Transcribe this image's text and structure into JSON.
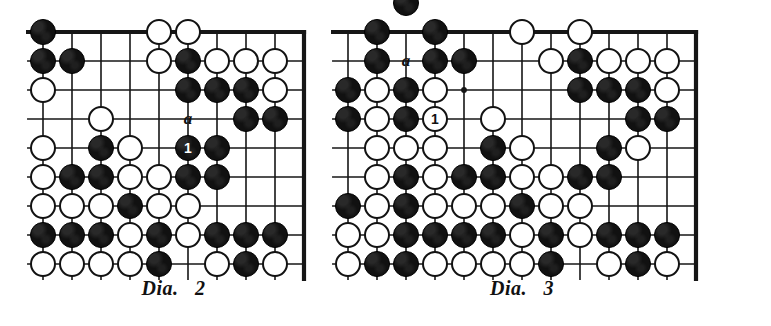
{
  "figure": {
    "kind": "go-board-diagram-pair",
    "colors": {
      "black_stone": "#111111",
      "white_stone": "#ffffff",
      "line": "#161616",
      "background": "#ffffff"
    }
  },
  "diagrams": [
    {
      "id": "dia-2",
      "caption": "Dia.   2",
      "caption_text": "Dia. 2",
      "number": "2",
      "origin": {
        "x": 43,
        "y": 32
      },
      "spacing": 29,
      "cols": 10,
      "rows": 9,
      "stone_radius": 13,
      "edges": {
        "top": true,
        "right": true,
        "left": false,
        "bottom": false
      },
      "star_points": [
        {
          "col": 1,
          "row": 2
        }
      ],
      "black_stones": [
        {
          "col": 0,
          "row": 1
        },
        {
          "col": 0,
          "row": 2
        },
        {
          "col": 1,
          "row": 2
        },
        {
          "col": 2,
          "row": 5
        },
        {
          "col": 5,
          "row": 2
        },
        {
          "col": 5,
          "row": 3
        },
        {
          "col": 6,
          "row": 3
        },
        {
          "col": 7,
          "row": 3
        },
        {
          "col": 7,
          "row": 4
        },
        {
          "col": 8,
          "row": 4
        },
        {
          "col": 6,
          "row": 5
        },
        {
          "col": 1,
          "row": 6
        },
        {
          "col": 2,
          "row": 6
        },
        {
          "col": 5,
          "row": 6
        },
        {
          "col": 6,
          "row": 6
        },
        {
          "col": 3,
          "row": 7
        },
        {
          "col": 0,
          "row": 8
        },
        {
          "col": 1,
          "row": 8
        },
        {
          "col": 2,
          "row": 8
        },
        {
          "col": 4,
          "row": 8
        },
        {
          "col": 6,
          "row": 8
        },
        {
          "col": 7,
          "row": 8
        },
        {
          "col": 8,
          "row": 8
        },
        {
          "col": 4,
          "row": 9
        },
        {
          "col": 7,
          "row": 9
        }
      ],
      "white_stones": [
        {
          "col": 4,
          "row": 1
        },
        {
          "col": 5,
          "row": 1
        },
        {
          "col": 0,
          "row": 3
        },
        {
          "col": 4,
          "row": 2
        },
        {
          "col": 6,
          "row": 2
        },
        {
          "col": 7,
          "row": 2
        },
        {
          "col": 8,
          "row": 2
        },
        {
          "col": 8,
          "row": 3
        },
        {
          "col": 2,
          "row": 4
        },
        {
          "col": 0,
          "row": 5
        },
        {
          "col": 3,
          "row": 5
        },
        {
          "col": 0,
          "row": 6
        },
        {
          "col": 3,
          "row": 6
        },
        {
          "col": 4,
          "row": 6
        },
        {
          "col": 0,
          "row": 7
        },
        {
          "col": 1,
          "row": 7
        },
        {
          "col": 2,
          "row": 7
        },
        {
          "col": 4,
          "row": 7
        },
        {
          "col": 5,
          "row": 7
        },
        {
          "col": 3,
          "row": 8
        },
        {
          "col": 5,
          "row": 8
        },
        {
          "col": 0,
          "row": 9
        },
        {
          "col": 1,
          "row": 9
        },
        {
          "col": 2,
          "row": 9
        },
        {
          "col": 3,
          "row": 9
        },
        {
          "col": 6,
          "row": 9
        },
        {
          "col": 8,
          "row": 9
        }
      ],
      "move_markers": [
        {
          "label": "1",
          "col": 5,
          "row": 5,
          "color": "black"
        }
      ],
      "point_labels": [
        {
          "label": "a",
          "col": 5,
          "row": 4
        }
      ]
    },
    {
      "id": "dia-3",
      "caption": "Dia.   3",
      "caption_text": "Dia. 3",
      "number": "3",
      "origin": {
        "x": 348,
        "y": 32
      },
      "spacing": 29,
      "cols": 13,
      "rows": 9,
      "stone_radius": 13,
      "edges": {
        "top": true,
        "right": true,
        "left": false,
        "bottom": false
      },
      "star_points": [
        {
          "col": 4,
          "row": 3
        }
      ],
      "black_stones": [
        {
          "col": 2,
          "row": 0
        },
        {
          "col": 1,
          "row": 1
        },
        {
          "col": 3,
          "row": 1
        },
        {
          "col": 1,
          "row": 2
        },
        {
          "col": 3,
          "row": 2
        },
        {
          "col": 4,
          "row": 2
        },
        {
          "col": 8,
          "row": 2
        },
        {
          "col": 0,
          "row": 3
        },
        {
          "col": 2,
          "row": 3
        },
        {
          "col": 8,
          "row": 3
        },
        {
          "col": 9,
          "row": 3
        },
        {
          "col": 10,
          "row": 3
        },
        {
          "col": 0,
          "row": 4
        },
        {
          "col": 2,
          "row": 4
        },
        {
          "col": 10,
          "row": 4
        },
        {
          "col": 11,
          "row": 4
        },
        {
          "col": 5,
          "row": 5
        },
        {
          "col": 9,
          "row": 5
        },
        {
          "col": 2,
          "row": 6
        },
        {
          "col": 4,
          "row": 6
        },
        {
          "col": 5,
          "row": 6
        },
        {
          "col": 8,
          "row": 6
        },
        {
          "col": 9,
          "row": 6
        },
        {
          "col": 0,
          "row": 7
        },
        {
          "col": 2,
          "row": 7
        },
        {
          "col": 6,
          "row": 7
        },
        {
          "col": 2,
          "row": 8
        },
        {
          "col": 3,
          "row": 8
        },
        {
          "col": 4,
          "row": 8
        },
        {
          "col": 5,
          "row": 8
        },
        {
          "col": 7,
          "row": 8
        },
        {
          "col": 9,
          "row": 8
        },
        {
          "col": 10,
          "row": 8
        },
        {
          "col": 11,
          "row": 8
        },
        {
          "col": 1,
          "row": 9
        },
        {
          "col": 2,
          "row": 9
        },
        {
          "col": 7,
          "row": 9
        },
        {
          "col": 10,
          "row": 9
        }
      ],
      "white_stones": [
        {
          "col": 6,
          "row": 1
        },
        {
          "col": 8,
          "row": 1
        },
        {
          "col": 7,
          "row": 2
        },
        {
          "col": 9,
          "row": 2
        },
        {
          "col": 10,
          "row": 2
        },
        {
          "col": 11,
          "row": 2
        },
        {
          "col": 1,
          "row": 3
        },
        {
          "col": 3,
          "row": 3
        },
        {
          "col": 11,
          "row": 3
        },
        {
          "col": 1,
          "row": 4
        },
        {
          "col": 5,
          "row": 4
        },
        {
          "col": 1,
          "row": 5
        },
        {
          "col": 2,
          "row": 5
        },
        {
          "col": 3,
          "row": 5
        },
        {
          "col": 6,
          "row": 5
        },
        {
          "col": 10,
          "row": 5
        },
        {
          "col": 1,
          "row": 6
        },
        {
          "col": 3,
          "row": 6
        },
        {
          "col": 6,
          "row": 6
        },
        {
          "col": 7,
          "row": 6
        },
        {
          "col": 1,
          "row": 7
        },
        {
          "col": 3,
          "row": 7
        },
        {
          "col": 4,
          "row": 7
        },
        {
          "col": 5,
          "row": 7
        },
        {
          "col": 7,
          "row": 7
        },
        {
          "col": 8,
          "row": 7
        },
        {
          "col": 0,
          "row": 8
        },
        {
          "col": 1,
          "row": 8
        },
        {
          "col": 6,
          "row": 8
        },
        {
          "col": 8,
          "row": 8
        },
        {
          "col": 0,
          "row": 9
        },
        {
          "col": 3,
          "row": 9
        },
        {
          "col": 4,
          "row": 9
        },
        {
          "col": 5,
          "row": 9
        },
        {
          "col": 6,
          "row": 9
        },
        {
          "col": 9,
          "row": 9
        },
        {
          "col": 11,
          "row": 9
        }
      ],
      "move_markers": [
        {
          "label": "1",
          "col": 3,
          "row": 4,
          "color": "white"
        }
      ],
      "point_labels": [
        {
          "label": "a",
          "col": 2,
          "row": 2
        }
      ]
    }
  ],
  "captions": {
    "left": "Dia.   2",
    "right": "Dia.   3"
  }
}
